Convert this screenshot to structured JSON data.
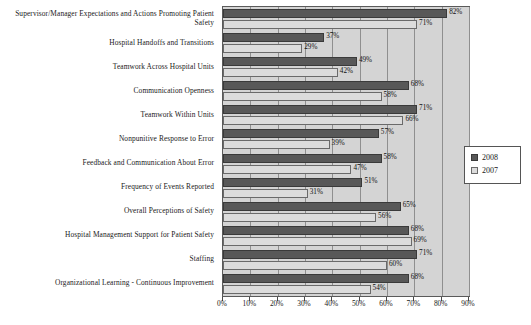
{
  "chart_data": {
    "type": "bar",
    "orientation": "horizontal",
    "title": "",
    "xlabel": "",
    "ylabel": "",
    "xlim": [
      0,
      90
    ],
    "xticks": [
      "0%",
      "10%",
      "20%",
      "30%",
      "40%",
      "50%",
      "60%",
      "70%",
      "80%",
      "90%"
    ],
    "grid": true,
    "legend_position": "right",
    "categories": [
      "Supervisor/Manager Expectations and Actions Promoting Patient Safety",
      "Hospital Handoffs and Transitions",
      "Teamwork Across Hospital Units",
      "Communication Openness",
      "Teamwork Within Units",
      "Nonpunitive Response to Error",
      "Feedback and Communication About Error",
      "Frequency of Events Reported",
      "Overall Perceptions of Safety",
      "Hospital Management Support for Patient Safety",
      "Staffing",
      "Organizational Learning - Continuous Improvement"
    ],
    "series": [
      {
        "name": "2008",
        "color": "#585858",
        "values": [
          82,
          37,
          49,
          68,
          71,
          57,
          58,
          51,
          65,
          68,
          71,
          68
        ],
        "labels": [
          "82%",
          "37%",
          "49%",
          "68%",
          "71%",
          "57%",
          "58%",
          "51%",
          "65%",
          "68%",
          "71%",
          "68%"
        ]
      },
      {
        "name": "2007",
        "color": "#dcdcdc",
        "values": [
          71,
          29,
          42,
          58,
          66,
          39,
          47,
          31,
          56,
          69,
          60,
          54
        ],
        "labels": [
          "71%",
          "29%",
          "42%",
          "58%",
          "66%",
          "39%",
          "47%",
          "31%",
          "56%",
          "69%",
          "60%",
          "54%"
        ]
      }
    ]
  },
  "legend": {
    "items": [
      {
        "label": "2008"
      },
      {
        "label": "2007"
      }
    ]
  }
}
